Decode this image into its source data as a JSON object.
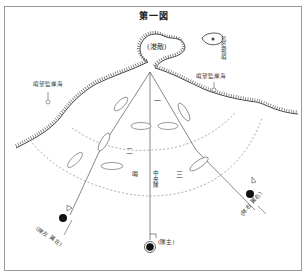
{
  "figure": {
    "title": "第一図"
  },
  "harbor": {
    "label": "(港敵)"
  },
  "island": {
    "label": "島監視哨"
  },
  "coast_stations": [
    {
      "label": "哨望監岸海",
      "side": "left"
    },
    {
      "label": "哨望監岸海",
      "side": "right"
    }
  ],
  "sectors": {
    "center_top": "一",
    "center_mid": "哨",
    "center_lower": "中央隊",
    "left_inner": "二",
    "right_inner": "三"
  },
  "units": [
    {
      "label": "(隊左 翼左)",
      "position": "left"
    },
    {
      "label": "(隊主)",
      "position": "center"
    },
    {
      "label": "(隊右 翼右)",
      "position": "right"
    }
  ],
  "colors": {
    "line": "#555555",
    "ink": "#333333",
    "frame": "#9a9a9a",
    "marker": "#111111"
  }
}
